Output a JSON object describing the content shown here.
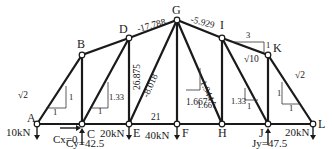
{
  "diagram": {
    "type": "truss",
    "nodes": {
      "A": {
        "label": "A"
      },
      "B": {
        "label": "B"
      },
      "C": {
        "label": "C"
      },
      "D": {
        "label": "D"
      },
      "E": {
        "label": "E"
      },
      "F": {
        "label": "F"
      },
      "G": {
        "label": "G"
      },
      "H": {
        "label": "H"
      },
      "I": {
        "label": "I"
      },
      "J": {
        "label": "J"
      },
      "K": {
        "label": "K"
      },
      "L": {
        "label": "L"
      }
    },
    "member_forces": {
      "DG": "-17.788",
      "GI": "-5.929",
      "DE": "26.875",
      "GE": "-8.018",
      "EF": "21",
      "GF": "1.667",
      "GH": "1.944"
    },
    "slopes": {
      "AB_hyp": "√2",
      "AB_rise": "1",
      "AB_run": "1",
      "CD_rise": "1.33",
      "CD_run": "1",
      "FG_rise": "1.667",
      "FG_run": "1",
      "IJ_rise": "1.33",
      "IJ_run": "1",
      "IK_run": "3",
      "IK_rise": "1",
      "IK_hyp": "√10",
      "KL_hyp": "√2",
      "KL_rise": "1",
      "KL_run": "1"
    },
    "loads": {
      "A": "10kN",
      "E": "20kN",
      "F": "40kN",
      "L": "20kN"
    },
    "reactions": {
      "Cx": "Cx=0",
      "Cy": "Cy=42.5",
      "Jy": "Jy=47.5"
    }
  }
}
